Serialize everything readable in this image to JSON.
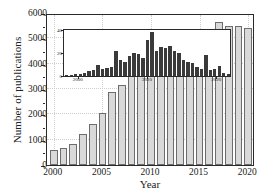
{
  "chart_data": {
    "type": "bar",
    "title": "",
    "xlabel": "Year",
    "ylabel": "Number of publications",
    "xlim": [
      1999.3,
      2020.7
    ],
    "ylim": [
      0,
      6000
    ],
    "grid": true,
    "legend": "none",
    "x_ticks": [
      "2000",
      "2005",
      "2010",
      "2015",
      "2020"
    ],
    "y_ticks": [
      "0",
      "1000",
      "2000",
      "3000",
      "4000",
      "5000",
      "6000"
    ],
    "categories": [
      "2000",
      "2001",
      "2002",
      "2003",
      "2004",
      "2005",
      "2006",
      "2007",
      "2008",
      "2009",
      "2010",
      "2011",
      "2012",
      "2013",
      "2014",
      "2015",
      "2016",
      "2017",
      "2018",
      "2019",
      "2020"
    ],
    "values": [
      580,
      670,
      820,
      1230,
      1610,
      2060,
      2870,
      3160,
      3620,
      4080,
      4620,
      4840,
      4940,
      4800,
      5170,
      4970,
      5350,
      5660,
      5490,
      5490,
      5410
    ],
    "bar_color": "#d9d9d9",
    "bar_edge_color": "#6d6d6d",
    "inset": {
      "type": "bar",
      "xlabel": "",
      "ylabel": "",
      "xlim": [
        1998,
        2022
      ],
      "ylim": [
        0,
        40
      ],
      "x_ticks": [
        "2000",
        "2010",
        "2020"
      ],
      "y_ticks": [
        "0",
        "20",
        "40"
      ],
      "bar_color": "#3a3a3a",
      "categories": [
        "1999",
        "2000",
        "2001",
        "2002",
        "2003",
        "2004",
        "2005",
        "2006",
        "2007",
        "2008",
        "2009",
        "2010",
        "2011",
        "2012",
        "2013",
        "2014",
        "2015",
        "2016",
        "2017",
        "2018",
        "2019",
        "2020",
        "2021"
      ],
      "values": [
        1,
        2,
        3,
        10,
        6,
        22,
        14,
        17,
        20,
        19,
        31,
        38,
        22,
        24,
        26,
        22,
        14,
        11,
        8,
        18,
        6,
        9,
        3
      ],
      "bin_values": [
        1,
        1,
        2,
        2,
        3,
        4,
        5,
        10,
        6,
        7,
        8,
        22,
        14,
        12,
        17,
        20,
        19,
        16,
        31,
        38,
        22,
        25,
        24,
        26,
        22,
        20,
        14,
        12,
        11,
        8,
        6,
        18,
        5,
        6,
        9,
        3,
        2
      ]
    }
  },
  "axes": {
    "x_title": "Year",
    "y_title": "Number of publications"
  }
}
